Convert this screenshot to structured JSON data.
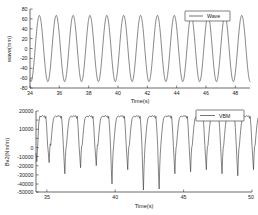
{
  "figure": {
    "background_color": "#ffffff",
    "line_color": "#3a3a3a"
  },
  "chart_data": [
    {
      "type": "line",
      "id": "wave-chart",
      "title": "",
      "xlabel": "Time(s)",
      "ylabel": "wave(mm)",
      "xlim": [
        34,
        49
      ],
      "ylim": [
        -80,
        80
      ],
      "xticks": [
        34,
        36,
        38,
        40,
        42,
        44,
        46,
        48
      ],
      "xtick_labels": [
        "34",
        "36",
        "38",
        "40",
        "42",
        "44",
        "46",
        "48"
      ],
      "yticks": [
        -80,
        -60,
        -40,
        -20,
        0,
        20,
        40,
        60,
        80
      ],
      "ytick_labels": [
        "-80",
        "-60",
        "-40",
        "-20",
        "0",
        "20",
        "40",
        "60",
        "80"
      ],
      "grid": false,
      "legend_position": "top-right",
      "series": [
        {
          "name": "Wave",
          "color": "#3a3a3a",
          "description": "regular sinusoidal wave elevation, period about 1.15 s, amplitude about 67 mm",
          "period": 1.15,
          "amplitude": 67,
          "phase_deg": 250,
          "mean": 0,
          "n_cycles": 13
        }
      ]
    },
    {
      "type": "line",
      "id": "vbm-chart",
      "title": "",
      "xlabel": "Time(s)",
      "ylabel": "Bv2(Nm/m)",
      "xlim": [
        34.2,
        50
      ],
      "ylim": [
        -60000,
        20000
      ],
      "xticks": [
        35,
        40,
        45,
        50
      ],
      "xtick_labels": [
        "35",
        "40",
        "45",
        "50"
      ],
      "yticks": [
        -50000,
        -40000,
        -30000,
        -20000,
        -10000,
        0,
        10000,
        20000
      ],
      "ytick_labels": [
        "-50000",
        "-40000",
        "-30000",
        "-20000",
        "-10000",
        "0",
        "10000",
        "20000"
      ],
      "grid": false,
      "legend_position": "top-right",
      "series": [
        {
          "name": "VBM",
          "color": "#3a3a3a",
          "description": "vertical bending moment with flat sagging plateaus near 15000 and sharp hogging spikes down to between -35000 and -58000",
          "plateau_level": 15000,
          "period": 1.15,
          "spike_minima": [
            -31000,
            -42000,
            -36000,
            -34000,
            -52000,
            -38000,
            -58000,
            -57000,
            -42000,
            -40000,
            -38000,
            -42000,
            -44000,
            -38000
          ],
          "n_cycles": 14
        }
      ]
    }
  ]
}
